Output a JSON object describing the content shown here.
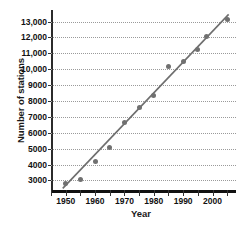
{
  "chart_data": {
    "type": "scatter",
    "title": "",
    "xlabel": "Year",
    "ylabel": "Number of stations",
    "xlim": [
      1945,
      2008
    ],
    "ylim": [
      2400,
      13600
    ],
    "grid": true,
    "legend": "none",
    "x_ticks": [
      1950,
      1960,
      1970,
      1980,
      1990,
      2000
    ],
    "x_tick_labels": [
      "1950",
      "1960",
      "1970",
      "1980",
      "1990",
      "2000"
    ],
    "x_minor_ticks": [
      1945,
      1955,
      1965,
      1975,
      1985,
      1995,
      2005
    ],
    "y_ticks": [
      3000,
      4000,
      5000,
      6000,
      7000,
      8000,
      9000,
      10000,
      11000,
      12000,
      13000
    ],
    "y_tick_labels": [
      "3000",
      "4000",
      "5000",
      "6000",
      "7000",
      "8000",
      "9000",
      "10,000",
      "11,000",
      "12,000",
      "13,000"
    ],
    "marker_color": "#707070",
    "line_color": "#6e6e6e",
    "x": [
      1950,
      1955,
      1960,
      1965,
      1970,
      1975,
      1980,
      1985,
      1990,
      1995,
      1998,
      2005
    ],
    "values": [
      2800,
      3050,
      4200,
      5100,
      6650,
      7600,
      8350,
      10150,
      10500,
      11250,
      12050,
      13150
    ],
    "points": [
      {
        "year": 1950,
        "stations": 2800
      },
      {
        "year": 1955,
        "stations": 3050
      },
      {
        "year": 1960,
        "stations": 4200
      },
      {
        "year": 1965,
        "stations": 5100
      },
      {
        "year": 1970,
        "stations": 6650
      },
      {
        "year": 1975,
        "stations": 7600
      },
      {
        "year": 1980,
        "stations": 8350
      },
      {
        "year": 1985,
        "stations": 10150
      },
      {
        "year": 1990,
        "stations": 10500
      },
      {
        "year": 1995,
        "stations": 11250
      },
      {
        "year": 1998,
        "stations": 12050
      },
      {
        "year": 2005,
        "stations": 13150
      }
    ],
    "trend_line": {
      "x_start": 1949,
      "y_start": 2500,
      "x_end": 2005.5,
      "y_end": 13450
    }
  }
}
